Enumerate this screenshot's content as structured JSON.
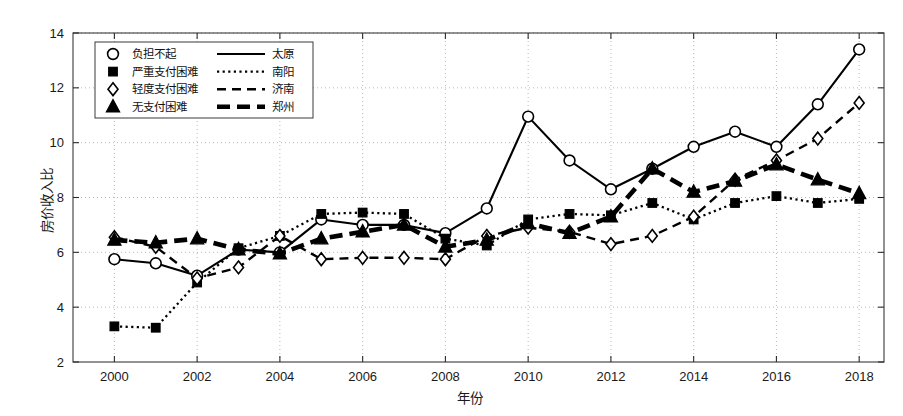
{
  "chart_data": {
    "type": "line",
    "title": "",
    "xlabel": "年份",
    "ylabel": "房价收入比",
    "xlim": [
      1999,
      2018.6
    ],
    "ylim": [
      2,
      14
    ],
    "ytick_labels": [
      "2",
      "4",
      "6",
      "8",
      "10",
      "12",
      "14"
    ],
    "yticks": [
      2,
      4,
      6,
      8,
      10,
      12,
      14
    ],
    "xtick_labels": [
      "2000",
      "2002",
      "2004",
      "2006",
      "2008",
      "2010",
      "2012",
      "2014",
      "2016",
      "2018"
    ],
    "xticks": [
      2000,
      2002,
      2004,
      2006,
      2008,
      2010,
      2012,
      2014,
      2016,
      2018
    ],
    "grid": true,
    "grid_style": "dotted",
    "legend_position": "top-left",
    "x": [
      2000,
      2001,
      2002,
      2003,
      2004,
      2005,
      2006,
      2007,
      2008,
      2009,
      2010,
      2011,
      2012,
      2013,
      2014,
      2015,
      2016,
      2017,
      2018
    ],
    "series": [
      {
        "name": "太原",
        "line_style": "solid",
        "color": "#000000",
        "values": [
          5.75,
          5.6,
          5.15,
          6.1,
          6.0,
          7.2,
          7.0,
          7.0,
          6.7,
          7.6,
          10.95,
          9.35,
          8.3,
          9.05,
          9.85,
          10.4,
          9.85,
          11.4,
          13.4
        ]
      },
      {
        "name": "南阳",
        "line_style": "dotted",
        "color": "#000000",
        "values": [
          3.3,
          3.25,
          4.9,
          6.15,
          6.6,
          7.4,
          7.45,
          7.4,
          6.5,
          6.25,
          7.2,
          7.4,
          7.35,
          7.8,
          7.2,
          7.8,
          8.05,
          7.8,
          7.95
        ]
      },
      {
        "name": "济南",
        "line_style": "dashed",
        "color": "#000000",
        "values": [
          6.55,
          6.2,
          5.05,
          5.45,
          6.6,
          5.75,
          5.8,
          5.8,
          5.75,
          6.6,
          6.9,
          6.75,
          6.3,
          6.6,
          7.3,
          8.65,
          9.35,
          10.15,
          11.45
        ]
      },
      {
        "name": "郑州",
        "line_style": "thick-dash",
        "color": "#000000",
        "values": [
          6.45,
          6.35,
          6.5,
          6.1,
          5.95,
          6.5,
          6.75,
          7.0,
          6.2,
          6.45,
          7.05,
          6.7,
          7.3,
          9.05,
          8.2,
          8.6,
          9.2,
          8.65,
          8.15
        ]
      }
    ],
    "marker_map": {
      "太原": "circle",
      "南阳": "square",
      "济南": "diamond",
      "郑州": "triangle"
    }
  },
  "legend": {
    "rows": [
      {
        "marker": "circle",
        "marker_label": "负担不起",
        "line_style": "solid",
        "city": "太原"
      },
      {
        "marker": "square",
        "marker_label": "严重支付困难",
        "line_style": "dotted",
        "city": "南阳"
      },
      {
        "marker": "diamond",
        "marker_label": "轻度支付困难",
        "line_style": "dashed",
        "city": "济南"
      },
      {
        "marker": "triangle",
        "marker_label": "无支付困难",
        "line_style": "thick-dash",
        "city": "郑州"
      }
    ]
  }
}
